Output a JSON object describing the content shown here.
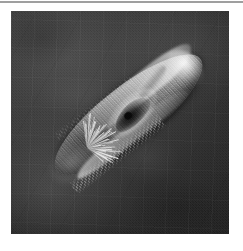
{
  "page": {
    "background_color": "#ffffff",
    "width": 243,
    "height": 251,
    "top_rule_color": "#8e8e8e"
  },
  "figure": {
    "kind": "scanning-electron-micrograph",
    "caption": "",
    "plate": {
      "x": 11,
      "y": 11,
      "width": 218,
      "height": 223,
      "background_color": "#303030",
      "border_color": "#6f6f6f"
    },
    "subject": {
      "name": "ciliate-protozoan",
      "description": "elongated cigar-shaped single-celled organism covered in cilia",
      "orientation_degrees": -38,
      "body_color_light": "#d7d7d7",
      "body_color_mid": "#8a8a8a",
      "body_color_dark": "#404040"
    },
    "features": [
      {
        "name": "anterior-tip",
        "label": "rounded bright anterior end"
      },
      {
        "name": "oral-groove",
        "label": "dark buccal cavity depression"
      },
      {
        "name": "surface-crease",
        "label": "contraction crease"
      },
      {
        "name": "ciliary-tuft",
        "label": "posterior tuft of cilia"
      },
      {
        "name": "ciliary-fringe",
        "label": "ventral fringe of cilia"
      },
      {
        "name": "longitudinal-striations",
        "label": "kinety rows on pellicle"
      }
    ]
  }
}
